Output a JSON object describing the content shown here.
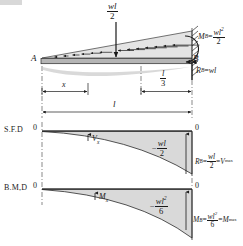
{
  "figure": {
    "type": "structural-beam-diagram",
    "beam": {
      "free_end_label": "A",
      "fixed_end_label": "B",
      "resultant_load_label": {
        "numerator": "wl",
        "denominator": "2"
      },
      "fixed_moment": {
        "symbol": "M",
        "subscript": "B",
        "equals": "=",
        "numerator": "wl",
        "numerator_exp": "2",
        "denominator": "2"
      },
      "reaction": {
        "symbol": "R",
        "subscript": "B",
        "equals": "=",
        "value": "wl"
      },
      "dimensions": {
        "x": "x",
        "third": {
          "numerator": "l",
          "denominator": "3"
        },
        "span": "l"
      }
    },
    "sfd": {
      "title": "S.F.D",
      "left_zero": "0",
      "right_zero": "0",
      "curve_label": {
        "symbol": "V",
        "subscript": "x"
      },
      "peak_label": {
        "sign": "−",
        "numerator": "wl",
        "denominator": "2"
      },
      "reaction_note": {
        "symbol": "R",
        "subscript": "B",
        "equals": "=",
        "numerator": "wl",
        "denominator": "2",
        "equals2": "=",
        "vmax_symbol": "V",
        "vmax_subscript": "max"
      }
    },
    "bmd": {
      "title": "B.M,D",
      "left_zero": "0",
      "right_zero": "0",
      "curve_label": {
        "symbol": "M",
        "subscript": "x"
      },
      "peak_label": {
        "sign": "−",
        "numerator": "wl",
        "numerator_exp": "2",
        "denominator": "6"
      },
      "moment_note": {
        "symbol": "M",
        "subscript": "B",
        "equals": "=",
        "numerator": "wl",
        "numerator_exp": "2",
        "denominator": "6",
        "equals2": "=",
        "mmax_symbol": "M",
        "mmax_subscript": "max"
      }
    },
    "colors": {
      "ink": "#1a1a1a",
      "fill": "#d9d9d9",
      "beam": "#b3b3b3",
      "deflection": "#cccccc",
      "background": "#ffffff"
    }
  }
}
